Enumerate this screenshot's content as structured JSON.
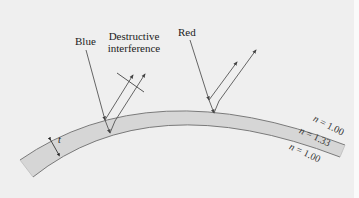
{
  "diagram": {
    "labels": {
      "blue": "Blue",
      "red": "Red",
      "destructive_line1": "Destructive",
      "destructive_line2": "interference",
      "thickness": "t"
    },
    "media": [
      {
        "symbol": "n",
        "eq": " = ",
        "value": "1.00",
        "position": "above film"
      },
      {
        "symbol": "n",
        "eq": " = ",
        "value": "1.33",
        "position": "film"
      },
      {
        "symbol": "n",
        "eq": " = ",
        "value": "1.00",
        "position": "below film"
      }
    ],
    "colors": {
      "background": "#efefef",
      "film_fill": "#d6d6d6",
      "film_edge": "#7a7a7a",
      "ray": "#555555",
      "text": "#222222"
    }
  }
}
